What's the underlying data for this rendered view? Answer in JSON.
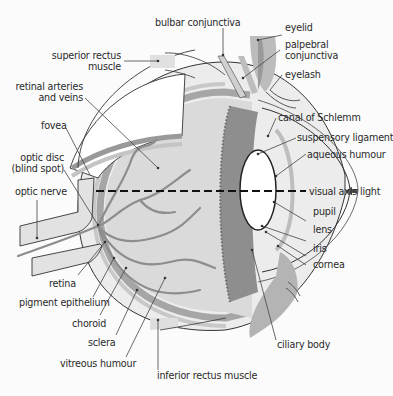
{
  "diagram": {
    "colors": {
      "background": "#fbfbfb",
      "line": "#333333",
      "sclera_fill": "#e4e4e4",
      "choroid_fill": "#a8a8a8",
      "vitreous_fill": "#dcdcdc",
      "vessels": "#8c8c8c",
      "ciliary": "#8f8f8f",
      "lens_fill": "#ffffff"
    },
    "labels": {
      "bulbar_conjunctiva": "bulbar conjunctiva",
      "eyelid": "eyelid",
      "palpebral_conjunctiva_1": "palpebral",
      "palpebral_conjunctiva_2": "conjunctiva",
      "eyelash": "eyelash",
      "superior_rectus_1": "superior rectus",
      "superior_rectus_2": "muscle",
      "retinal_vessels_1": "retinal arteries",
      "retinal_vessels_2": "and veins",
      "fovea": "fovea",
      "optic_disc_1": "optic disc",
      "optic_disc_2": "(blind spot)",
      "optic_nerve": "optic nerve",
      "canal_of_schlemm": "canal of Schlemm",
      "suspensory_ligament": "suspensory ligament",
      "aqueous_humour": "aqueous humour",
      "visual_axis": "visual axis",
      "light": "light",
      "pupil": "pupil",
      "lens": "lens",
      "iris": "iris",
      "cornea": "cornea",
      "retina": "retina",
      "pigment_epithelium": "pigment epithelium",
      "choroid": "choroid",
      "sclera": "sclera",
      "vitreous_humour": "vitreous humour",
      "ciliary_body": "ciliary body",
      "inferior_rectus_muscle": "inferior rectus muscle"
    },
    "icons": {
      "light_arrow": "arrow-left-icon"
    }
  }
}
